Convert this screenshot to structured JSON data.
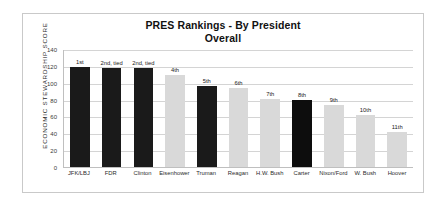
{
  "chart_data": {
    "type": "bar",
    "title": "PRES Rankings - By President",
    "subtitle": "Overall",
    "xlabel": "",
    "ylabel": "ECONOMIC STEWARDSHIP SCORE",
    "ylim": [
      0,
      140
    ],
    "yticks": [
      140,
      120,
      100,
      80,
      60,
      40,
      20,
      0
    ],
    "grid": true,
    "legend": null,
    "categories": [
      "JFK/LBJ",
      "FDR",
      "Clinton",
      "Eisenhower",
      "Truman",
      "Reagan",
      "H.W. Bush",
      "Carter",
      "Nixon/Ford",
      "W. Bush",
      "Hoover"
    ],
    "values": [
      119,
      117,
      117,
      109,
      96,
      94,
      81,
      79,
      74,
      62,
      42
    ],
    "point_labels": [
      "1st",
      "2nd, tied",
      "2nd, tied",
      "4th",
      "5th",
      "6th",
      "7th",
      "8th",
      "9th",
      "10th",
      "11th"
    ],
    "bar_colors": [
      "#1a1a1a",
      "#1a1a1a",
      "#1a1a1a",
      "#d9d9d9",
      "#1a1a1a",
      "#d9d9d9",
      "#d9d9d9",
      "#0d0d0d",
      "#d9d9d9",
      "#d9d9d9",
      "#d9d9d9"
    ],
    "accent_dark": "#1a1a1a",
    "accent_light": "#d9d9d9",
    "frame_color": "#c9c9c9",
    "grid_color": "#d4d4d4"
  }
}
